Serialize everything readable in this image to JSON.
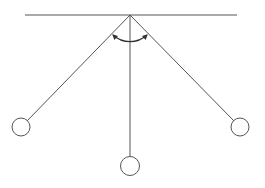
{
  "diagram": {
    "stroke_color": "#555555",
    "bob_fill": "#ffffff",
    "elements": [
      "ceiling",
      "pivot",
      "left-string",
      "center-string",
      "right-string",
      "left-bob",
      "center-bob",
      "right-bob",
      "angle-arc"
    ]
  }
}
